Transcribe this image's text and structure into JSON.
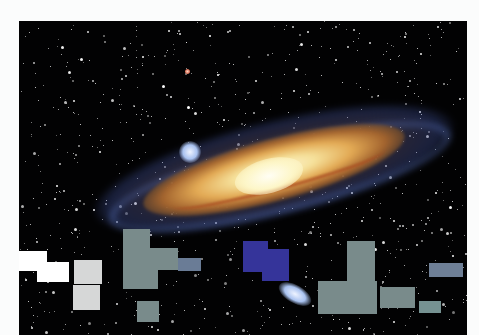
{
  "scene": {
    "subject": "spiral galaxy in starfield",
    "colors": {
      "page_background": "#fbfcfc",
      "space": "#020203",
      "galaxy_core": "#fdf6c8",
      "galaxy_dust": "#a3642e",
      "galaxy_arms": "#6e8ce6"
    }
  },
  "overlay_blocks": [
    {
      "id": "white-1",
      "x": 0,
      "y": 230,
      "w": 28,
      "h": 20,
      "color": "#ffffff"
    },
    {
      "id": "white-2",
      "x": 18,
      "y": 241,
      "w": 32,
      "h": 20,
      "color": "#ffffff"
    },
    {
      "id": "lightgray-1",
      "x": 55,
      "y": 239,
      "w": 28,
      "h": 24,
      "color": "#d6d7d7"
    },
    {
      "id": "lightgray-2",
      "x": 54,
      "y": 264,
      "w": 27,
      "h": 25,
      "color": "#d6d7d7"
    },
    {
      "id": "teal-1",
      "x": 104,
      "y": 208,
      "w": 27,
      "h": 20,
      "color": "#798b8b"
    },
    {
      "id": "teal-2",
      "x": 104,
      "y": 227,
      "w": 55,
      "h": 22,
      "color": "#798b8b"
    },
    {
      "id": "teal-3",
      "x": 104,
      "y": 248,
      "w": 35,
      "h": 20,
      "color": "#798b8b"
    },
    {
      "id": "bluegray-1",
      "x": 159,
      "y": 237,
      "w": 23,
      "h": 13,
      "color": "#6a7c96"
    },
    {
      "id": "teal-4",
      "x": 118,
      "y": 280,
      "w": 22,
      "h": 21,
      "color": "#798b8b"
    },
    {
      "id": "blue-1",
      "x": 224,
      "y": 220,
      "w": 25,
      "h": 31,
      "color": "#35349a"
    },
    {
      "id": "blue-2",
      "x": 243,
      "y": 228,
      "w": 27,
      "h": 32,
      "color": "#35349a"
    },
    {
      "id": "teal-5",
      "x": 328,
      "y": 220,
      "w": 28,
      "h": 40,
      "color": "#798b8b"
    },
    {
      "id": "teal-6",
      "x": 299,
      "y": 260,
      "w": 59,
      "h": 33,
      "color": "#798b8b"
    },
    {
      "id": "teal-7",
      "x": 361,
      "y": 266,
      "w": 35,
      "h": 21,
      "color": "#798b8b"
    },
    {
      "id": "teal-8",
      "x": 400,
      "y": 280,
      "w": 22,
      "h": 12,
      "color": "#769292"
    },
    {
      "id": "bluegray-2",
      "x": 410,
      "y": 242,
      "w": 34,
      "h": 14,
      "color": "#6e7f96"
    }
  ]
}
